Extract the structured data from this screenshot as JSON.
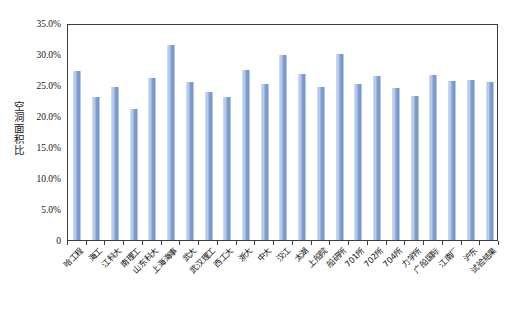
{
  "chart_data": {
    "type": "bar",
    "title": "",
    "xlabel": "",
    "ylabel": "空洞面积比",
    "ylim": [
      0,
      0.35
    ],
    "grid": false,
    "legend": "none",
    "y_tick_labels": [
      "35.0%",
      "30.0%",
      "25.0%",
      "20.0%",
      "15.0%",
      "10.0%",
      "5.0%",
      "0"
    ],
    "y_tick_values": [
      0.35,
      0.3,
      0.25,
      0.2,
      0.15,
      0.1,
      0.05,
      0.0
    ],
    "categories": [
      "哈工程",
      "海工",
      "江科大",
      "南理工",
      "山东科大",
      "上海海事",
      "武大",
      "武汉理工",
      "西工大",
      "浙大",
      "中大",
      "汉江",
      "太湖",
      "上船院",
      "船研所",
      "701所",
      "702所",
      "704所",
      "力学所",
      "广船国际",
      "江南厂",
      "沪东",
      "试验结果"
    ],
    "values": [
      0.272,
      0.231,
      0.247,
      0.211,
      0.261,
      0.315,
      0.255,
      0.239,
      0.231,
      0.275,
      0.252,
      0.299,
      0.267,
      0.247,
      0.3,
      0.252,
      0.264,
      0.245,
      0.233,
      0.266,
      0.257,
      0.258,
      0.255
    ],
    "value_labels": [
      "27.2%",
      "23.1%",
      "24.7%",
      "21.1%",
      "26.1%",
      "31.5%",
      "25.5%",
      "23.9%",
      "23.1%",
      "27.5%",
      "25.2%",
      "29.9%",
      "26.7%",
      "24.7%",
      "30.0%",
      "25.2%",
      "26.4%",
      "24.5%",
      "23.3%",
      "26.6%",
      "25.7%",
      "25.8%",
      "25.5%"
    ],
    "bar_color": "#7d9fd2",
    "axis_color": "#3d3d3d",
    "background_color": "#ffffff"
  }
}
